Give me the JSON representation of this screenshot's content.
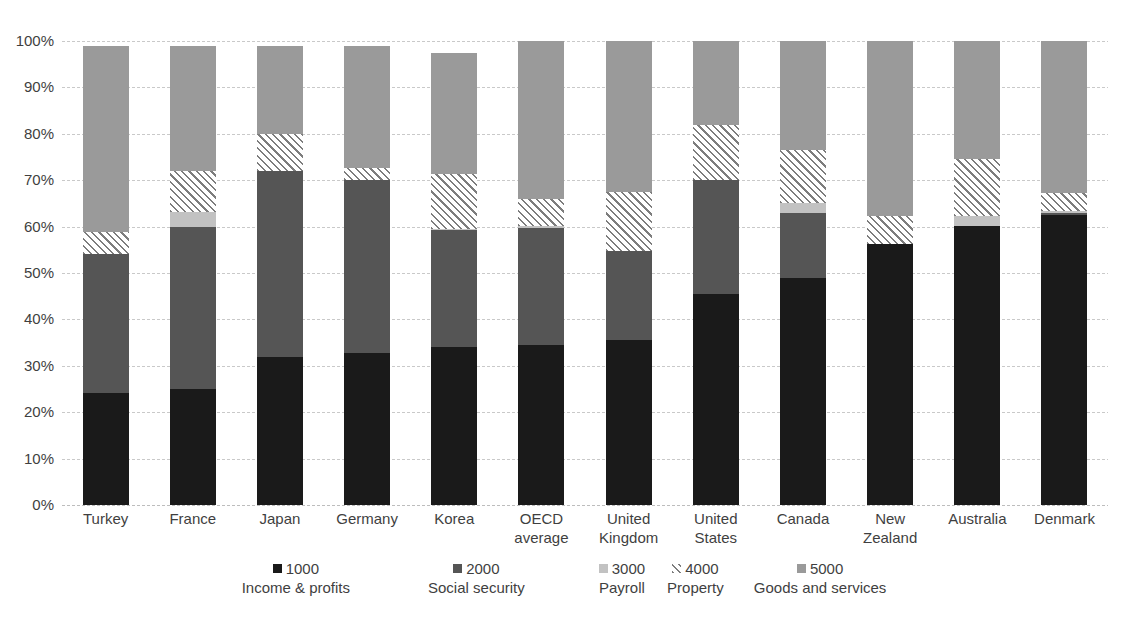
{
  "chart_data": {
    "type": "bar",
    "subtype": "stacked-bar-100-percent",
    "title": "",
    "xlabel": "",
    "ylabel": "",
    "ylim": [
      0,
      100
    ],
    "ytick_labels": [
      "100%",
      "90%",
      "80%",
      "70%",
      "60%",
      "50%",
      "40%",
      "30%",
      "20%",
      "10%",
      "0%"
    ],
    "ytick_values": [
      100,
      90,
      80,
      70,
      60,
      50,
      40,
      30,
      20,
      10,
      0
    ],
    "grid": true,
    "legend_position": "bottom",
    "categories": [
      "Turkey",
      "France",
      "Japan",
      "Germany",
      "Korea",
      "OECD average",
      "United Kingdom",
      "United States",
      "Canada",
      "New Zealand",
      "Australia",
      "Denmark"
    ],
    "category_label_lines": [
      [
        "Turkey"
      ],
      [
        "France"
      ],
      [
        "Japan"
      ],
      [
        "Germany"
      ],
      [
        "Korea"
      ],
      [
        "OECD",
        "average"
      ],
      [
        "United",
        "Kingdom"
      ],
      [
        "United",
        "States"
      ],
      [
        "Canada"
      ],
      [
        "New Zealand"
      ],
      [
        "Australia"
      ],
      [
        "Denmark"
      ]
    ],
    "series": [
      {
        "code": "1000",
        "name": "Income & profits",
        "fill": "solid-black",
        "color": "#1a1a1a",
        "values": [
          24.2,
          25.0,
          32.0,
          32.8,
          34.0,
          34.4,
          35.5,
          45.5,
          49.0,
          56.2,
          60.2,
          62.4
        ]
      },
      {
        "code": "2000",
        "name": "Social security",
        "fill": "solid-dark-gray",
        "color": "#555555",
        "values": [
          30.0,
          35.0,
          40.0,
          37.2,
          25.2,
          25.4,
          19.3,
          24.5,
          14.0,
          0.0,
          0.0,
          0.6
        ]
      },
      {
        "code": "3000",
        "name": "Payroll",
        "fill": "solid-light-gray",
        "color": "#c2c2c2",
        "values": [
          0.0,
          3.1,
          0.0,
          0.0,
          0.3,
          0.3,
          0.0,
          0.0,
          2.0,
          0.0,
          2.0,
          0.3
        ]
      },
      {
        "code": "4000",
        "name": "Property",
        "fill": "diagonal-hatch",
        "color": "#7d7d7d",
        "values": [
          4.6,
          8.9,
          8.0,
          2.7,
          11.8,
          5.9,
          12.7,
          11.9,
          11.5,
          6.0,
          12.3,
          3.9
        ]
      },
      {
        "code": "5000",
        "name": "Goods and services",
        "fill": "solid-medium-gray",
        "color": "#9a9a9a",
        "values": [
          40.2,
          27.0,
          19.0,
          26.3,
          26.2,
          34.0,
          32.5,
          18.1,
          23.5,
          37.8,
          25.5,
          32.8
        ]
      }
    ]
  },
  "legend": {
    "items": [
      {
        "code": "1000",
        "desc": "Income & profits"
      },
      {
        "code": "2000",
        "desc": "Social security"
      },
      {
        "code": "3000",
        "desc": "Payroll"
      },
      {
        "code": "4000",
        "desc": "Property"
      },
      {
        "code": "5000",
        "desc": "Goods and services"
      }
    ]
  }
}
